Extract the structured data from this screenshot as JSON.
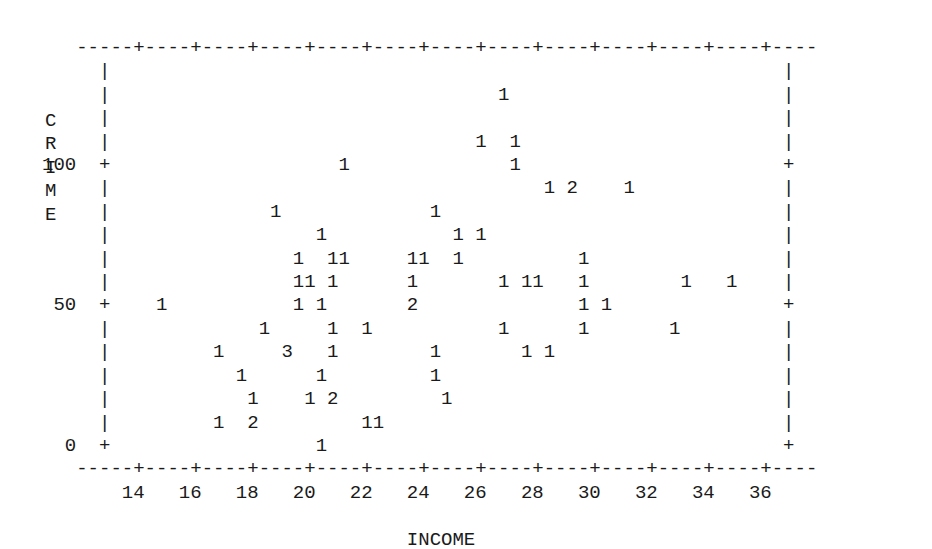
{
  "chart_data": {
    "type": "scatter",
    "title": "",
    "subtitle": "",
    "xlabel": "INCOME",
    "ylabel": "CRIME",
    "ylabel_vertical_chars": [
      "C",
      "R",
      "I",
      "M",
      "E"
    ],
    "xlim": [
      13,
      37
    ],
    "ylim": [
      0,
      130
    ],
    "xticks": [
      14,
      16,
      18,
      20,
      22,
      24,
      26,
      28,
      30,
      32,
      34,
      36
    ],
    "xtick_labels": [
      "14",
      "16",
      "18",
      "20",
      "22",
      "24",
      "26",
      "28",
      "30",
      "32",
      "34",
      "36"
    ],
    "yticks": [
      0,
      50,
      100
    ],
    "ytick_labels": [
      "0",
      "50",
      "100"
    ],
    "grid": false,
    "legend": null,
    "marker_style": "count-digit",
    "points": [
      {
        "income": 27.0,
        "crime": 122,
        "count": 1
      },
      {
        "income": 26.2,
        "crime": 106,
        "count": 1
      },
      {
        "income": 27.2,
        "crime": 106,
        "count": 1
      },
      {
        "income": 27.2,
        "crime": 99,
        "count": 1
      },
      {
        "income": 21.5,
        "crime": 99,
        "count": 1
      },
      {
        "income": 28.6,
        "crime": 88,
        "count": 1
      },
      {
        "income": 29.5,
        "crime": 88,
        "count": 2
      },
      {
        "income": 31.2,
        "crime": 88,
        "count": 1
      },
      {
        "income": 19.0,
        "crime": 80,
        "count": 1
      },
      {
        "income": 24.6,
        "crime": 80,
        "count": 1
      },
      {
        "income": 20.7,
        "crime": 72,
        "count": 1
      },
      {
        "income": 25.4,
        "crime": 72,
        "count": 1
      },
      {
        "income": 26.4,
        "crime": 72,
        "count": 1
      },
      {
        "income": 19.9,
        "crime": 64,
        "count": 1
      },
      {
        "income": 21.0,
        "crime": 64,
        "count": 1
      },
      {
        "income": 21.3,
        "crime": 64,
        "count": 1
      },
      {
        "income": 23.8,
        "crime": 64,
        "count": 1
      },
      {
        "income": 24.1,
        "crime": 64,
        "count": 1
      },
      {
        "income": 25.3,
        "crime": 64,
        "count": 1
      },
      {
        "income": 29.9,
        "crime": 64,
        "count": 1
      },
      {
        "income": 19.9,
        "crime": 57,
        "count": 1
      },
      {
        "income": 20.2,
        "crime": 57,
        "count": 1
      },
      {
        "income": 21.0,
        "crime": 57,
        "count": 1
      },
      {
        "income": 23.8,
        "crime": 57,
        "count": 1
      },
      {
        "income": 26.9,
        "crime": 57,
        "count": 1
      },
      {
        "income": 27.7,
        "crime": 57,
        "count": 1
      },
      {
        "income": 28.0,
        "crime": 57,
        "count": 1
      },
      {
        "income": 29.6,
        "crime": 57,
        "count": 1
      },
      {
        "income": 33.5,
        "crime": 57,
        "count": 1
      },
      {
        "income": 35.0,
        "crime": 57,
        "count": 1
      },
      {
        "income": 15.0,
        "crime": 49,
        "count": 1
      },
      {
        "income": 19.6,
        "crime": 49,
        "count": 1
      },
      {
        "income": 20.7,
        "crime": 49,
        "count": 1
      },
      {
        "income": 23.8,
        "crime": 49,
        "count": 2
      },
      {
        "income": 29.6,
        "crime": 49,
        "count": 1
      },
      {
        "income": 30.5,
        "crime": 49,
        "count": 1
      },
      {
        "income": 18.5,
        "crime": 41,
        "count": 1
      },
      {
        "income": 20.9,
        "crime": 41,
        "count": 1
      },
      {
        "income": 22.0,
        "crime": 41,
        "count": 1
      },
      {
        "income": 22.3,
        "crime": 41,
        "count": 1
      },
      {
        "income": 26.9,
        "crime": 41,
        "count": 1
      },
      {
        "income": 29.6,
        "crime": 41,
        "count": 1
      },
      {
        "income": 33.0,
        "crime": 41,
        "count": 1
      },
      {
        "income": 17.2,
        "crime": 33,
        "count": 1
      },
      {
        "income": 19.3,
        "crime": 33,
        "count": 3
      },
      {
        "income": 20.9,
        "crime": 33,
        "count": 1
      },
      {
        "income": 24.5,
        "crime": 33,
        "count": 1
      },
      {
        "income": 27.7,
        "crime": 33,
        "count": 1
      },
      {
        "income": 28.6,
        "crime": 33,
        "count": 1
      },
      {
        "income": 17.9,
        "crime": 26,
        "count": 1
      },
      {
        "income": 20.7,
        "crime": 26,
        "count": 1
      },
      {
        "income": 24.4,
        "crime": 26,
        "count": 1
      },
      {
        "income": 18.2,
        "crime": 19,
        "count": 1
      },
      {
        "income": 20.3,
        "crime": 19,
        "count": 1
      },
      {
        "income": 21.2,
        "crime": 19,
        "count": 2
      },
      {
        "income": 25.0,
        "crime": 19,
        "count": 1
      },
      {
        "income": 17.2,
        "crime": 11,
        "count": 1
      },
      {
        "income": 18.4,
        "crime": 11,
        "count": 2
      },
      {
        "income": 22.2,
        "crime": 11,
        "count": 1
      },
      {
        "income": 22.5,
        "crime": 11,
        "count": 1
      },
      {
        "income": 20.6,
        "crime": 1,
        "count": 1
      }
    ],
    "ascii_rows": [
      "     ---+----+----+----+----+----+----+----+----+----+----+----+--",
      "     |                                  1                      |",
      "     |                                                         |",
      "     |                                                         |",
      "     |                               1  1                      |",
      "100 +|                    1          1                         +",
      "     |                                 1  2     1              |",
      "     |             1              1                            |",
      "     |                1             1  1                       |",
      "     |           1  11         11  1          1                |",
      "     |           11 1          1         1 11 1       1   1    |",
      " 50 +|    1          1   1     2               1   1          +",
      "     |         1        1  11        1         1         1     |",
      "     |      1     3     1         1        1 1                 |",
      "     |        1      1          1                              |",
      "     |          1    1  2        1                             |",
      "     |      1   2        11                                    |",
      "  0 +|             1                                           +",
      "     ---+----+----+----+----+----+----+----+----+----+----+--",
      "        14   16   18   20   22   24   26   28   30   32   34   36"
    ]
  },
  "plot": {
    "grid_lines": [
      "   ----+----+----+----+----+----+----+----+----+----+----+----+--",
      "   |                                  1                        |",
      "   |                                                           |",
      "   |                                                           |",
      "   |                              1     1                      |",
      "   +                 1            1                            +",
      "   |                              1                            |",
      "   |                                 1   2       1             |",
      "   |            1             1                                |",
      "   |               1            1   1                          |",
      "   |          1   11        11  1           1                  |",
      "   |          11 1          1        1  11  1        1    1    |",
      "   +     1         1    1   2             1    1             +",
      "   |        1         1   11       1        1         1        |",
      "   |     1      3     1        1        1  1                   |",
      "   |       1       1         1                                 |",
      "   |         1     1   2       1                               |",
      "   |     1   2         11                                      |",
      "   +            1                                              +",
      "   ----+----+----+----+----+----+----+----+----+----+----+----+--"
    ],
    "axis_tick_char": "+",
    "axis_horizontal_char": "-",
    "axis_vertical_char": "|",
    "marker_chars": [
      "1",
      "2",
      "3"
    ]
  },
  "colors": {
    "background": "#ffffff",
    "ink": "#1a1a1a"
  }
}
